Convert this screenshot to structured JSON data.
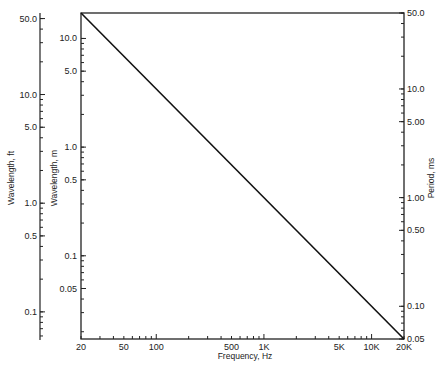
{
  "chart_data": {
    "type": "line",
    "title": "",
    "xlabel": "Frequency, Hz",
    "ylabel_left_outer": "Wavelength, ft",
    "ylabel_left_inner": "Wavelength, m",
    "ylabel_right": "Period, ms",
    "xscale": "log",
    "yscale": "log",
    "xlim": [
      20,
      20000
    ],
    "grid": false,
    "legend": null,
    "x_ticks": [
      {
        "value": 20,
        "label": "20"
      },
      {
        "value": 50,
        "label": "50"
      },
      {
        "value": 100,
        "label": "100"
      },
      {
        "value": 500,
        "label": "500"
      },
      {
        "value": 1000,
        "label": "1K"
      },
      {
        "value": 5000,
        "label": "5K"
      },
      {
        "value": 10000,
        "label": "10K"
      },
      {
        "value": 20000,
        "label": "20K"
      }
    ],
    "y_right_ticks": [
      {
        "value": 50.0,
        "label": "50.0"
      },
      {
        "value": 10.0,
        "label": "10.0"
      },
      {
        "value": 5.0,
        "label": "5.00"
      },
      {
        "value": 1.0,
        "label": "1.00"
      },
      {
        "value": 0.5,
        "label": "0.50"
      },
      {
        "value": 0.1,
        "label": "0.10"
      },
      {
        "value": 0.05,
        "label": "0.05"
      }
    ],
    "y_left_m_ticks": [
      {
        "value": 10.0,
        "label": "10.0"
      },
      {
        "value": 5.0,
        "label": "5.0"
      },
      {
        "value": 1.0,
        "label": "1.0"
      },
      {
        "value": 0.5,
        "label": "0.5"
      },
      {
        "value": 0.1,
        "label": "0.1"
      },
      {
        "value": 0.05,
        "label": "0.05"
      }
    ],
    "y_left_ft_ticks": [
      {
        "value": 50.0,
        "label": "50.0"
      },
      {
        "value": 10.0,
        "label": "10.0"
      },
      {
        "value": 5.0,
        "label": "5.0"
      },
      {
        "value": 1.0,
        "label": "1.0"
      },
      {
        "value": 0.5,
        "label": "0.5"
      },
      {
        "value": 0.1,
        "label": "0.1"
      }
    ],
    "series": [
      {
        "name": "Wavelength / Period vs Frequency",
        "x": [
          20,
          20000
        ],
        "period_ms": [
          50.0,
          0.05
        ],
        "wavelength_m": [
          17.15,
          0.01715
        ],
        "wavelength_ft": [
          56.3,
          0.0563
        ]
      }
    ]
  }
}
